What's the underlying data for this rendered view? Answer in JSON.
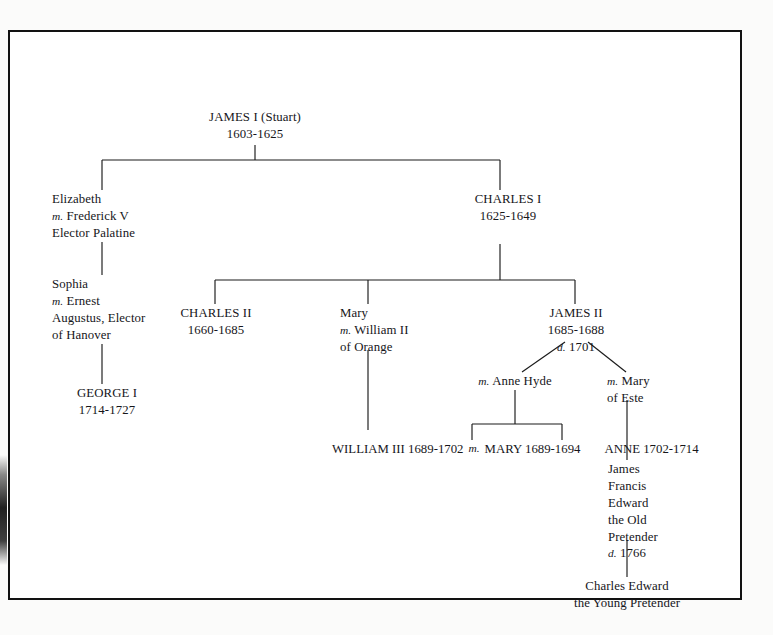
{
  "document": {
    "title": "Stuart and Hanover royal family tree",
    "background_color": "#fbfbfa",
    "page_color": "#ffffff",
    "line_color": "#1a1a1a",
    "text_color": "#16161a"
  },
  "nodes": {
    "james_i": {
      "name": "JAMES I (Stuart)",
      "dates": "1603-1625"
    },
    "elizabeth": {
      "name": "Elizabeth",
      "marriage_prefix": "m.",
      "spouse": "Frederick V",
      "spouse_title": "Elector Palatine"
    },
    "sophia": {
      "name": "Sophia",
      "marriage_prefix": "m.",
      "spouse": "Ernest",
      "spouse_title_line1": "Augustus, Elector",
      "spouse_title_line2": "of Hanover"
    },
    "george_i": {
      "name": "GEORGE I",
      "dates": "1714-1727"
    },
    "charles_i": {
      "name": "CHARLES I",
      "dates": "1625-1649"
    },
    "charles_ii": {
      "name": "CHARLES II",
      "dates": "1660-1685"
    },
    "mary_orange": {
      "name": "Mary",
      "marriage_prefix": "m.",
      "spouse": "William II",
      "spouse_title": "of Orange"
    },
    "james_ii": {
      "name": "JAMES II",
      "dates": "1685-1688",
      "death_prefix": "d.",
      "death_year": "1701"
    },
    "anne_hyde": {
      "marriage_prefix": "m.",
      "name": "Anne Hyde"
    },
    "mary_este": {
      "marriage_prefix": "m.",
      "name_line1": "Mary",
      "name_line2": "of Este"
    },
    "william_iii": {
      "name": "WILLIAM III",
      "dates": "1689-1702"
    },
    "marriage_joiner": "m.",
    "mary_ii": {
      "name": "MARY",
      "dates": "1689-1694"
    },
    "anne": {
      "name": "ANNE",
      "dates": "1702-1714"
    },
    "old_pretender": {
      "line1": "James",
      "line2": "Francis",
      "line3": "Edward",
      "line4": "the Old",
      "line5": "Pretender",
      "death_prefix": "d.",
      "death_year": "1766"
    },
    "young_pretender": {
      "line1": "Charles Edward",
      "line2": "the Young Pretender"
    }
  }
}
